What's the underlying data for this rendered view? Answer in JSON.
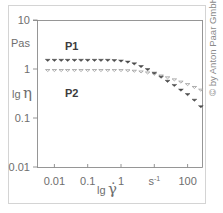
{
  "chart_data": {
    "type": "scatter",
    "title": "",
    "xlabel": "lg γ̇",
    "ylabel": "lg η",
    "y_unit": "Pas",
    "x_unit": "s⁻¹",
    "xscale": "log",
    "yscale": "log",
    "xlim": [
      0.003,
      270
    ],
    "ylim": [
      0.01,
      10
    ],
    "grid": false,
    "x_ticks": [
      {
        "value": 0.01,
        "label": "0.01"
      },
      {
        "value": 0.1,
        "label": "0.1"
      },
      {
        "value": 1,
        "label": "1"
      },
      {
        "value": 10,
        "label": "s⁻¹"
      },
      {
        "value": 100,
        "label": "100"
      }
    ],
    "y_ticks": [
      {
        "value": 10,
        "label": "10"
      },
      {
        "value": 1,
        "label": "1"
      },
      {
        "value": 0.1,
        "label": "0.1"
      },
      {
        "value": 0.01,
        "label": "0.01"
      }
    ],
    "series": [
      {
        "name": "P1",
        "marker": "filled-down-triangle",
        "color": "#4a4a4a",
        "x": [
          0.0063,
          0.01,
          0.016,
          0.025,
          0.04,
          0.063,
          0.1,
          0.16,
          0.25,
          0.4,
          0.63,
          1.0,
          1.6,
          2.5,
          4.0,
          6.3,
          10,
          16,
          25,
          40,
          63,
          100,
          160,
          250
        ],
        "y": [
          1.5,
          1.5,
          1.5,
          1.5,
          1.5,
          1.5,
          1.5,
          1.5,
          1.5,
          1.5,
          1.48,
          1.45,
          1.38,
          1.27,
          1.12,
          0.97,
          0.82,
          0.68,
          0.56,
          0.46,
          0.37,
          0.3,
          0.23,
          0.17
        ]
      },
      {
        "name": "P2",
        "marker": "open-down-triangle",
        "color": "#9a9a9a",
        "x": [
          0.0063,
          0.01,
          0.016,
          0.025,
          0.04,
          0.063,
          0.1,
          0.16,
          0.25,
          0.4,
          0.63,
          1.0,
          1.6,
          2.5,
          4.0,
          6.3,
          10,
          16,
          25,
          40,
          63,
          100,
          160,
          250
        ],
        "y": [
          0.93,
          0.93,
          0.93,
          0.93,
          0.93,
          0.93,
          0.93,
          0.93,
          0.93,
          0.93,
          0.93,
          0.93,
          0.92,
          0.9,
          0.87,
          0.83,
          0.78,
          0.72,
          0.66,
          0.6,
          0.54,
          0.48,
          0.42,
          0.37
        ]
      }
    ],
    "annotations": [
      {
        "text": "P1",
        "near_series": "P1"
      },
      {
        "text": "P2",
        "near_series": "P2"
      }
    ],
    "legend": "inline labels"
  },
  "labels": {
    "y_unit": "Pas",
    "y_axis_lg": "lg",
    "y_axis_symbol": "η",
    "x_axis_lg": "lg",
    "x_axis_symbol": "γ̇",
    "series_p1": "P1",
    "series_p2": "P2",
    "copyright": "© by Anton Paar GmbH"
  }
}
